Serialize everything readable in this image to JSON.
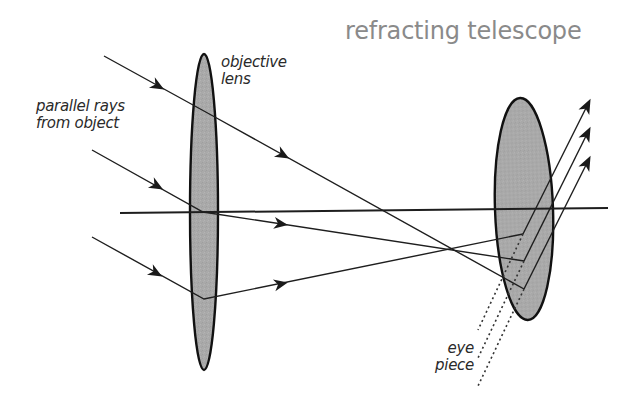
{
  "title": "refracting telescope",
  "labels": {
    "objective_line1": "objective",
    "objective_line2": "lens",
    "parallel_line1": "parallel rays",
    "parallel_line2": "from object",
    "eyepiece_line1": "eye",
    "eyepiece_line2": "piece"
  },
  "colors": {
    "lens_fill": "#a9a9a9",
    "line": "#1e1e1e",
    "title": "#8a8a8a",
    "label": "#2a2a2a"
  },
  "geometry": {
    "optical_axis": {
      "x1": 120,
      "y1": 213,
      "x2": 608,
      "y2": 208
    },
    "objective_lens": {
      "cx": 204,
      "cy": 212,
      "rx": 14,
      "ry": 158
    },
    "eyepiece_lens": {
      "cx": 524,
      "cy": 209,
      "rx": 29,
      "ry": 111
    },
    "incoming_rays": [
      {
        "start": [
          104,
          56
        ],
        "bend": [
          213,
          116
        ],
        "cross": [
          440,
          240
        ],
        "end": [
          524,
          289
        ]
      },
      {
        "start": [
          92,
          150
        ],
        "bend": [
          203,
          212
        ],
        "end": [
          524,
          261
        ]
      },
      {
        "start": [
          92,
          237
        ],
        "bend": [
          204,
          299
        ],
        "end": [
          523,
          234
        ]
      }
    ],
    "outgoing_rays": [
      {
        "from": [
          523,
          234
        ],
        "to": [
          590,
          100
        ]
      },
      {
        "from": [
          524,
          261
        ],
        "to": [
          590,
          128
        ]
      },
      {
        "from": [
          524,
          289
        ],
        "to": [
          590,
          157
        ]
      }
    ],
    "dotted_lines": [
      {
        "from": [
          523,
          234
        ],
        "to": [
          478,
          330
        ]
      },
      {
        "from": [
          524,
          261
        ],
        "to": [
          478,
          358
        ]
      },
      {
        "from": [
          524,
          289
        ],
        "to": [
          478,
          386
        ]
      }
    ]
  }
}
